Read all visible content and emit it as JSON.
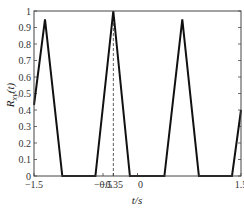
{
  "chart_data": {
    "type": "line",
    "title": "",
    "xlabel": "t/s",
    "ylabel": "R_xy(t)",
    "xlim": [
      -1.5,
      1.5
    ],
    "ylim": [
      0,
      1
    ],
    "x_ticks": [
      "-1.5",
      "-0.5",
      "-0.35",
      "0",
      "1.5"
    ],
    "x_tick_values": [
      -1.5,
      -0.5,
      -0.35,
      0,
      1.5
    ],
    "y_ticks": [
      "0",
      "0.1",
      "0.2",
      "0.3",
      "0.4",
      "0.5",
      "0.6",
      "0.7",
      "0.8",
      "0.9",
      "1"
    ],
    "grid": false,
    "annotations": [
      {
        "type": "dashed-vertical-line",
        "x": -0.35
      }
    ],
    "series": [
      {
        "name": "R_xy(t)",
        "x": [
          -1.5,
          -1.34,
          -1.09,
          -0.61,
          -0.35,
          -0.11,
          0.39,
          0.65,
          0.89,
          1.37,
          1.5
        ],
        "y": [
          0.43,
          0.95,
          0,
          0,
          1.0,
          0,
          0,
          0.95,
          0,
          0,
          0.4
        ]
      }
    ]
  }
}
